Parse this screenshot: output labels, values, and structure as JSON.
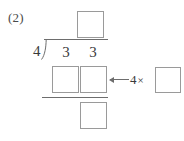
{
  "problem": {
    "number_label": "(2)",
    "operation": "long-division",
    "divisor": "4",
    "dividend_digits": [
      "3",
      "3"
    ],
    "dividend": "33",
    "quotient_value": "",
    "product_digits": [
      "",
      ""
    ],
    "remainder_value": ""
  },
  "annotation": {
    "multiplier": "4",
    "times_symbol": "×",
    "factor_value": "",
    "arrow": "left-arrow"
  },
  "colors": {
    "ink": "#3a3a3a",
    "rule": "#6d6d6d",
    "box_border": "#9a9a9a",
    "page": "#ffffff"
  }
}
